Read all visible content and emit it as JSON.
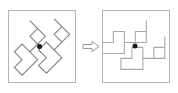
{
  "figure": {
    "background_color": "#ffffff",
    "width": 178,
    "height": 93
  },
  "panels": [
    {
      "id": "panel-before",
      "name": "before-rotation-panel",
      "label": "Before",
      "border_color": "#b5b5b5",
      "fill_color": "#ffffff",
      "rotation_degrees": 0,
      "shapes": [
        {
          "name": "zigzag-shape-left",
          "stroke_color": "#808080",
          "fill": "none",
          "points": "30,8 42,20 30,32 36,38 48,26 54,32 42,44 36,38 24,50 18,44 30,32 24,26 12,38 6,32 18,20 24,26 36,14"
        },
        {
          "name": "zigzag-shape-right",
          "stroke_color": "#808080",
          "fill": "none",
          "points": "30,8 42,20 30,32 36,38 48,26 54,32 42,44 36,38 24,50 18,44 30,32 24,26 12,38 6,32 18,20 24,26 36,14"
        }
      ],
      "pivot": {
        "name": "pivot-dot",
        "color": "#1a1a1a",
        "x": 34,
        "y": 36,
        "radius": 2.6
      }
    },
    {
      "id": "panel-after",
      "name": "after-rotation-panel",
      "label": "After",
      "border_color": "#b5b5b5",
      "fill_color": "#ffffff",
      "rotation_degrees": 45,
      "shapes": [
        {
          "name": "zigzag-shape-left-rotated",
          "stroke_color": "#a8a8a8",
          "fill": "none"
        },
        {
          "name": "zigzag-shape-right-rotated",
          "stroke_color": "#a8a8a8",
          "fill": "none"
        }
      ],
      "pivot": {
        "name": "pivot-dot",
        "color": "#1a1a1a",
        "x": 34,
        "y": 36,
        "radius": 2.6
      }
    }
  ],
  "connector": {
    "name": "right-arrow-icon",
    "direction": "right",
    "style": "hollow-outline",
    "stroke_color": "#9a9a9a",
    "fill_color": "#ffffff"
  }
}
